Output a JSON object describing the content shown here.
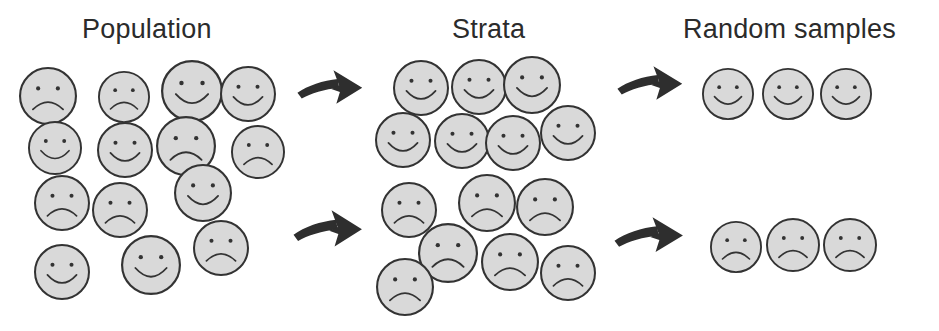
{
  "figure": {
    "kind": "stratified-random-sampling-diagram",
    "background_color": "#ffffff",
    "width": 939,
    "height": 331
  },
  "style": {
    "face_fill": "#d9d9d9",
    "face_stroke": "#333333",
    "feature_stroke": "#333333",
    "arrow_fill": "#2e2e2e",
    "title_color": "#2b2b2b"
  },
  "titles": {
    "population": "Population",
    "strata": "Strata",
    "random_samples": "Random samples"
  },
  "title_positions": {
    "population": {
      "x": 82,
      "y": 16
    },
    "strata": {
      "x": 452,
      "y": 16
    },
    "random_samples": {
      "x": 683,
      "y": 16
    }
  },
  "population": {
    "label": "Population",
    "happy_count": 7,
    "sad_count": 7,
    "total": 14,
    "faces": [
      {
        "mood": "sad",
        "cx": 48,
        "cy": 96,
        "r": 29
      },
      {
        "mood": "sad",
        "cx": 124,
        "cy": 97,
        "r": 26
      },
      {
        "mood": "happy",
        "cx": 192,
        "cy": 91,
        "r": 31
      },
      {
        "mood": "happy",
        "cx": 248,
        "cy": 94,
        "r": 28
      },
      {
        "mood": "happy",
        "cx": 55,
        "cy": 148,
        "r": 27
      },
      {
        "mood": "happy",
        "cx": 125,
        "cy": 150,
        "r": 28
      },
      {
        "mood": "sad",
        "cx": 186,
        "cy": 146,
        "r": 30
      },
      {
        "mood": "sad",
        "cx": 258,
        "cy": 152,
        "r": 27
      },
      {
        "mood": "happy",
        "cx": 203,
        "cy": 193,
        "r": 29
      },
      {
        "mood": "sad",
        "cx": 62,
        "cy": 203,
        "r": 28
      },
      {
        "mood": "sad",
        "cx": 120,
        "cy": 210,
        "r": 28
      },
      {
        "mood": "sad",
        "cx": 221,
        "cy": 248,
        "r": 28
      },
      {
        "mood": "happy",
        "cx": 62,
        "cy": 272,
        "r": 28
      },
      {
        "mood": "happy",
        "cx": 151,
        "cy": 265,
        "r": 30
      }
    ]
  },
  "strata": {
    "label": "Strata",
    "upper": {
      "name": "happy-stratum",
      "mood": "happy",
      "count": 7,
      "faces": [
        {
          "mood": "happy",
          "cx": 421,
          "cy": 88,
          "r": 28
        },
        {
          "mood": "happy",
          "cx": 479,
          "cy": 87,
          "r": 28
        },
        {
          "mood": "happy",
          "cx": 532,
          "cy": 85,
          "r": 29
        },
        {
          "mood": "happy",
          "cx": 403,
          "cy": 140,
          "r": 28
        },
        {
          "mood": "happy",
          "cx": 462,
          "cy": 141,
          "r": 28
        },
        {
          "mood": "happy",
          "cx": 513,
          "cy": 143,
          "r": 28
        },
        {
          "mood": "happy",
          "cx": 568,
          "cy": 133,
          "r": 28
        }
      ]
    },
    "lower": {
      "name": "sad-stratum",
      "mood": "sad",
      "count": 7,
      "faces": [
        {
          "mood": "sad",
          "cx": 409,
          "cy": 210,
          "r": 28
        },
        {
          "mood": "sad",
          "cx": 487,
          "cy": 203,
          "r": 29
        },
        {
          "mood": "sad",
          "cx": 545,
          "cy": 207,
          "r": 29
        },
        {
          "mood": "sad",
          "cx": 448,
          "cy": 253,
          "r": 30
        },
        {
          "mood": "sad",
          "cx": 510,
          "cy": 262,
          "r": 29
        },
        {
          "mood": "sad",
          "cx": 405,
          "cy": 287,
          "r": 29
        },
        {
          "mood": "sad",
          "cx": 568,
          "cy": 273,
          "r": 28
        }
      ]
    }
  },
  "random_samples": {
    "label": "Random samples",
    "upper": {
      "name": "happy-sample",
      "mood": "happy",
      "count": 3,
      "faces": [
        {
          "mood": "happy",
          "cx": 728,
          "cy": 94,
          "r": 26
        },
        {
          "mood": "happy",
          "cx": 788,
          "cy": 94,
          "r": 26
        },
        {
          "mood": "happy",
          "cx": 846,
          "cy": 94,
          "r": 26
        }
      ]
    },
    "lower": {
      "name": "sad-sample",
      "mood": "sad",
      "count": 3,
      "faces": [
        {
          "mood": "sad",
          "cx": 736,
          "cy": 247,
          "r": 26
        },
        {
          "mood": "sad",
          "cx": 793,
          "cy": 245,
          "r": 27
        },
        {
          "mood": "sad",
          "cx": 850,
          "cy": 245,
          "r": 27
        }
      ]
    }
  },
  "arrows": [
    {
      "name": "arrow-population-to-happy-stratum",
      "x": 296,
      "y": 68,
      "w": 72,
      "h": 48,
      "flip": false
    },
    {
      "name": "arrow-population-to-sad-stratum",
      "x": 292,
      "y": 208,
      "w": 76,
      "h": 52,
      "flip": false
    },
    {
      "name": "arrow-happy-stratum-to-sample",
      "x": 616,
      "y": 64,
      "w": 72,
      "h": 48,
      "flip": false
    },
    {
      "name": "arrow-sad-stratum-to-sample",
      "x": 613,
      "y": 215,
      "w": 76,
      "h": 50,
      "flip": false
    }
  ]
}
